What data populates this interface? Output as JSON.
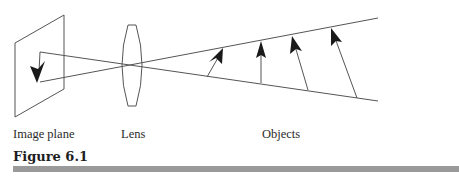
{
  "figure": {
    "caption": "Figure 6.1",
    "labels": {
      "image_plane": "Image plane",
      "lens": "Lens",
      "objects": "Objects"
    },
    "colors": {
      "line": "#555555",
      "arrow": "#1a1a1a",
      "rule": "#9a9a9a",
      "text": "#2a2a2a"
    }
  },
  "diagram": {
    "image_plane": {
      "points": [
        [
          15,
          43
        ],
        [
          64,
          15
        ],
        [
          64,
          89
        ],
        [
          15,
          117
        ]
      ]
    },
    "lens": {
      "cx": 132,
      "top": 25,
      "bottom": 106,
      "half_width": 8
    },
    "rays": [
      {
        "from": [
          40,
          52
        ],
        "to": [
          378,
          101
        ]
      },
      {
        "from": [
          40,
          82
        ],
        "to": [
          378,
          18
        ]
      }
    ],
    "image_arrow": {
      "base": [
        40,
        52
      ],
      "tip": [
        37,
        82
      ]
    },
    "object_arrows": [
      {
        "base": [
          207,
          77
        ],
        "tip": [
          223,
          48
        ]
      },
      {
        "base": [
          261,
          83
        ],
        "tip": [
          261,
          41
        ]
      },
      {
        "base": [
          308,
          90
        ],
        "tip": [
          292,
          36
        ]
      },
      {
        "base": [
          357,
          98
        ],
        "tip": [
          331,
          28
        ]
      }
    ]
  }
}
